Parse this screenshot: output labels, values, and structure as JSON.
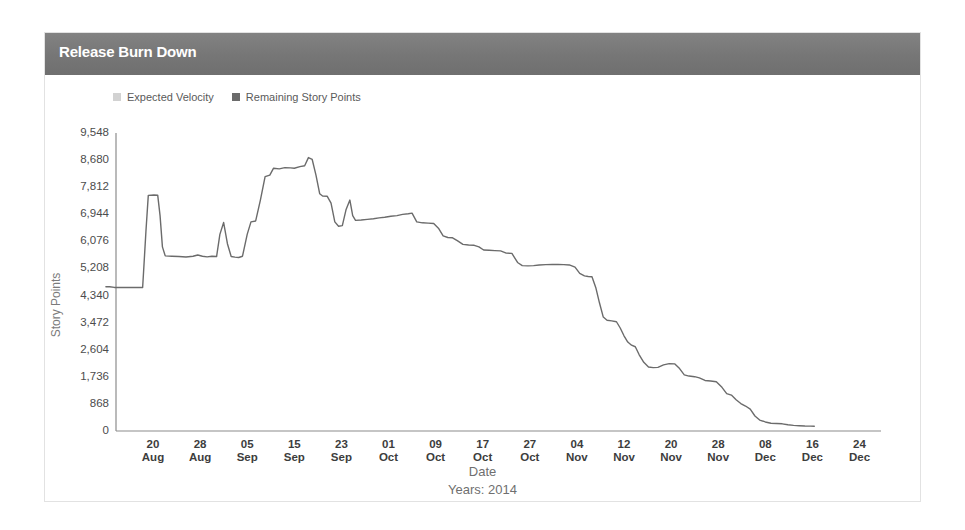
{
  "panel": {
    "title": "Release Burn Down"
  },
  "legend": [
    {
      "label": "Expected Velocity",
      "color": "#d2d2d2",
      "icon": "legend-swatch-square"
    },
    {
      "label": "Remaining Story Points",
      "color": "#6b6b6b",
      "icon": "legend-swatch-square"
    }
  ],
  "axis": {
    "y_title": "Story Points",
    "x_title": "Date",
    "x_subtitle": "Years: 2014"
  },
  "chart_data": {
    "type": "line",
    "title": "Release Burn Down",
    "xlabel": "Date",
    "ylabel": "Story Points",
    "subtitle": "Years: 2014",
    "grid": false,
    "legend_position": "top-left",
    "ylim": [
      0,
      9548
    ],
    "yticks": [
      0,
      868,
      1736,
      2604,
      3472,
      4340,
      5208,
      6076,
      6944,
      7812,
      8680,
      9548
    ],
    "ytick_labels": [
      "0",
      "868",
      "1,736",
      "2,604",
      "3,472",
      "4,340",
      "5,208",
      "6,076",
      "6,944",
      "7,812",
      "8,680",
      "9,548"
    ],
    "xticks": [
      "20 Aug",
      "28 Aug",
      "05 Sep",
      "15 Sep",
      "23 Sep",
      "01 Oct",
      "09 Oct",
      "17 Oct",
      "27 Oct",
      "04 Nov",
      "12 Nov",
      "20 Nov",
      "28 Nov",
      "08 Dec",
      "16 Dec",
      "24 Dec"
    ],
    "xtick_labels": [
      {
        "day": "20",
        "month": "Aug"
      },
      {
        "day": "28",
        "month": "Aug"
      },
      {
        "day": "05",
        "month": "Sep"
      },
      {
        "day": "15",
        "month": "Sep"
      },
      {
        "day": "23",
        "month": "Sep"
      },
      {
        "day": "01",
        "month": "Oct"
      },
      {
        "day": "09",
        "month": "Oct"
      },
      {
        "day": "17",
        "month": "Oct"
      },
      {
        "day": "27",
        "month": "Oct"
      },
      {
        "day": "04",
        "month": "Nov"
      },
      {
        "day": "12",
        "month": "Nov"
      },
      {
        "day": "20",
        "month": "Nov"
      },
      {
        "day": "28",
        "month": "Nov"
      },
      {
        "day": "08",
        "month": "Dec"
      },
      {
        "day": "16",
        "month": "Dec"
      },
      {
        "day": "24",
        "month": "Dec"
      }
    ],
    "series": [
      {
        "name": "Remaining Story Points",
        "color": "#6b6b6b",
        "x_start": "16 Aug",
        "x_end": "17 Dec",
        "points": [
          [
            0.0,
            4620
          ],
          [
            0.08,
            4620
          ],
          [
            0.18,
            4600
          ],
          [
            0.3,
            4600
          ],
          [
            0.4,
            4600
          ],
          [
            0.52,
            4600
          ],
          [
            0.6,
            4600
          ],
          [
            0.7,
            4600
          ],
          [
            0.78,
            4600
          ],
          [
            0.8,
            5100
          ],
          [
            0.85,
            6400
          ],
          [
            0.9,
            7550
          ],
          [
            1.02,
            7560
          ],
          [
            1.1,
            7555
          ],
          [
            1.15,
            6900
          ],
          [
            1.2,
            5900
          ],
          [
            1.26,
            5610
          ],
          [
            1.4,
            5600
          ],
          [
            1.55,
            5590
          ],
          [
            1.7,
            5575
          ],
          [
            1.85,
            5600
          ],
          [
            1.95,
            5640
          ],
          [
            2.05,
            5600
          ],
          [
            2.15,
            5580
          ],
          [
            2.25,
            5600
          ],
          [
            2.35,
            5590
          ],
          [
            2.42,
            6300
          ],
          [
            2.5,
            6680
          ],
          [
            2.58,
            6000
          ],
          [
            2.66,
            5590
          ],
          [
            2.74,
            5570
          ],
          [
            2.82,
            5560
          ],
          [
            2.9,
            5600
          ],
          [
            3.0,
            6300
          ],
          [
            3.08,
            6700
          ],
          [
            3.18,
            6730
          ],
          [
            3.28,
            7400
          ],
          [
            3.38,
            8150
          ],
          [
            3.48,
            8200
          ],
          [
            3.56,
            8420
          ],
          [
            3.68,
            8400
          ],
          [
            3.8,
            8440
          ],
          [
            3.92,
            8430
          ],
          [
            4.0,
            8420
          ],
          [
            4.12,
            8470
          ],
          [
            4.22,
            8500
          ],
          [
            4.3,
            8760
          ],
          [
            4.38,
            8700
          ],
          [
            4.46,
            8200
          ],
          [
            4.54,
            7600
          ],
          [
            4.6,
            7530
          ],
          [
            4.7,
            7520
          ],
          [
            4.78,
            7300
          ],
          [
            4.86,
            6700
          ],
          [
            4.94,
            6560
          ],
          [
            5.02,
            6580
          ],
          [
            5.1,
            7100
          ],
          [
            5.18,
            7400
          ],
          [
            5.24,
            6900
          ],
          [
            5.3,
            6750
          ],
          [
            5.42,
            6760
          ],
          [
            5.55,
            6780
          ],
          [
            5.68,
            6800
          ],
          [
            5.8,
            6830
          ],
          [
            5.92,
            6850
          ],
          [
            6.05,
            6880
          ],
          [
            6.18,
            6900
          ],
          [
            6.3,
            6940
          ],
          [
            6.42,
            6960
          ],
          [
            6.5,
            6980
          ],
          [
            6.6,
            6700
          ],
          [
            6.72,
            6670
          ],
          [
            6.84,
            6660
          ],
          [
            6.96,
            6650
          ],
          [
            7.06,
            6500
          ],
          [
            7.16,
            6250
          ],
          [
            7.26,
            6200
          ],
          [
            7.36,
            6190
          ],
          [
            7.46,
            6100
          ],
          [
            7.58,
            5980
          ],
          [
            7.7,
            5960
          ],
          [
            7.82,
            5950
          ],
          [
            7.92,
            5900
          ],
          [
            8.02,
            5800
          ],
          [
            8.14,
            5790
          ],
          [
            8.26,
            5780
          ],
          [
            8.38,
            5770
          ],
          [
            8.5,
            5700
          ],
          [
            8.62,
            5690
          ],
          [
            8.74,
            5400
          ],
          [
            8.84,
            5300
          ],
          [
            8.96,
            5290
          ],
          [
            9.08,
            5300
          ],
          [
            9.2,
            5320
          ],
          [
            9.34,
            5330
          ],
          [
            9.48,
            5340
          ],
          [
            9.6,
            5335
          ],
          [
            9.72,
            5330
          ],
          [
            9.84,
            5320
          ],
          [
            9.96,
            5250
          ],
          [
            10.06,
            5050
          ],
          [
            10.16,
            4970
          ],
          [
            10.24,
            4950
          ],
          [
            10.32,
            4940
          ],
          [
            10.4,
            4600
          ],
          [
            10.48,
            4100
          ],
          [
            10.56,
            3650
          ],
          [
            10.64,
            3550
          ],
          [
            10.74,
            3530
          ],
          [
            10.84,
            3500
          ],
          [
            10.92,
            3300
          ],
          [
            11.0,
            3050
          ],
          [
            11.08,
            2850
          ],
          [
            11.16,
            2750
          ],
          [
            11.24,
            2700
          ],
          [
            11.32,
            2450
          ],
          [
            11.42,
            2200
          ],
          [
            11.52,
            2050
          ],
          [
            11.62,
            2030
          ],
          [
            11.72,
            2040
          ],
          [
            11.84,
            2120
          ],
          [
            11.96,
            2160
          ],
          [
            12.08,
            2150
          ],
          [
            12.18,
            2000
          ],
          [
            12.28,
            1800
          ],
          [
            12.38,
            1760
          ],
          [
            12.5,
            1740
          ],
          [
            12.6,
            1700
          ],
          [
            12.72,
            1620
          ],
          [
            12.84,
            1600
          ],
          [
            12.96,
            1580
          ],
          [
            13.08,
            1400
          ],
          [
            13.18,
            1200
          ],
          [
            13.28,
            1150
          ],
          [
            13.38,
            1000
          ],
          [
            13.48,
            880
          ],
          [
            13.58,
            800
          ],
          [
            13.68,
            700
          ],
          [
            13.78,
            480
          ],
          [
            13.88,
            350
          ],
          [
            14.0,
            290
          ],
          [
            14.12,
            250
          ],
          [
            14.24,
            240
          ],
          [
            14.36,
            230
          ],
          [
            14.48,
            200
          ],
          [
            14.6,
            180
          ],
          [
            14.72,
            170
          ],
          [
            14.84,
            160
          ],
          [
            14.96,
            155
          ],
          [
            15.04,
            150
          ]
        ]
      },
      {
        "name": "Expected Velocity",
        "color": "#d2d2d2",
        "points": []
      }
    ]
  }
}
